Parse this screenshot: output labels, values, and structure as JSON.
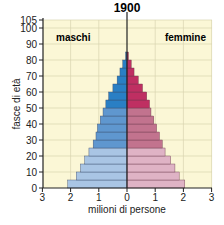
{
  "chart_data": {
    "type": "bar",
    "subtype": "population-pyramid",
    "title": "1900",
    "xlabel": "milioni di persone",
    "ylabel": "fasce di età",
    "xticks": [
      "3",
      "2",
      "1",
      "0",
      "1",
      "2",
      "3"
    ],
    "yticks": [
      0,
      10,
      20,
      30,
      40,
      50,
      60,
      70,
      80,
      90,
      100,
      105
    ],
    "xlim": [
      -3,
      3
    ],
    "ylim": [
      0,
      105
    ],
    "grid": true,
    "legend": {
      "left": "maschi",
      "right": "femmine"
    },
    "categories": [
      "0-4",
      "5-9",
      "10-14",
      "15-19",
      "20-24",
      "25-29",
      "30-34",
      "35-39",
      "40-44",
      "45-49",
      "50-54",
      "55-59",
      "60-64",
      "65-69",
      "70-74",
      "75-79",
      "80+"
    ],
    "series": [
      {
        "name": "maschi",
        "color": "#6a9fd4",
        "values": [
          2.1,
          1.8,
          1.65,
          1.5,
          1.35,
          1.2,
          1.1,
          1.05,
          0.95,
          0.85,
          0.75,
          0.65,
          0.5,
          0.35,
          0.25,
          0.15,
          0.05
        ]
      },
      {
        "name": "femmine",
        "color": "#c87a92",
        "values": [
          2.05,
          1.85,
          1.7,
          1.55,
          1.35,
          1.25,
          1.15,
          1.05,
          0.95,
          0.85,
          0.8,
          0.7,
          0.55,
          0.4,
          0.25,
          0.15,
          0.05
        ]
      }
    ]
  }
}
